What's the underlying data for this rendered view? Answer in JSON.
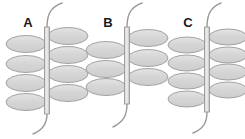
{
  "figure": {
    "background_color": "#ffffff",
    "width": 245,
    "height": 139,
    "leaflet_fill": "#d6d6d6",
    "leaflet_stroke": "#9a9a9a",
    "rachis_fill": "#e2e2e2",
    "rachis_stroke": "#9a9a9a",
    "label_color": "#1a1a1a"
  },
  "panels": [
    {
      "label": "A",
      "label_x": 28,
      "label_y": 27,
      "axis_x": 47,
      "leaflet_count_left": 4,
      "leaflet_count_right": 4,
      "leaflet_rx": 20,
      "leaflet_ry": 8.5,
      "left_leaflets": [
        {
          "cx": 26,
          "cy": 44
        },
        {
          "cx": 26,
          "cy": 64
        },
        {
          "cx": 26,
          "cy": 83
        },
        {
          "cx": 26,
          "cy": 102
        }
      ],
      "right_leaflets": [
        {
          "cx": 68,
          "cy": 36
        },
        {
          "cx": 68,
          "cy": 55
        },
        {
          "cx": 68,
          "cy": 74
        },
        {
          "cx": 68,
          "cy": 93
        }
      ],
      "rachis_top_y": 27,
      "rachis_bottom_y": 114,
      "tendril_top": "M47,27 C47,14 51,7 62,3",
      "tendril_bottom": "M47,114 C47,124 43,130 33,134"
    },
    {
      "label": "B",
      "label_x": 108,
      "label_y": 27,
      "axis_x": 127,
      "leaflet_count_left": 3,
      "leaflet_count_right": 3,
      "leaflet_rx": 20,
      "leaflet_ry": 8.5,
      "left_leaflets": [
        {
          "cx": 106,
          "cy": 50
        },
        {
          "cx": 106,
          "cy": 69
        },
        {
          "cx": 106,
          "cy": 87
        }
      ],
      "right_leaflets": [
        {
          "cx": 148,
          "cy": 38
        },
        {
          "cx": 148,
          "cy": 58
        },
        {
          "cx": 148,
          "cy": 77
        }
      ],
      "rachis_top_y": 27,
      "rachis_bottom_y": 104,
      "tendril_top": "M127,27 C127,14 131,7 142,3",
      "tendril_bottom": "M127,104 C127,116 123,122 113,127"
    },
    {
      "label": "C",
      "label_x": 188,
      "label_y": 27,
      "axis_x": 207,
      "leaflet_count_left": 4,
      "leaflet_count_right": 4,
      "leaflet_rx": 19,
      "leaflet_ry": 8,
      "left_leaflets": [
        {
          "cx": 187,
          "cy": 45
        },
        {
          "cx": 187,
          "cy": 63
        },
        {
          "cx": 187,
          "cy": 81
        },
        {
          "cx": 187,
          "cy": 99
        }
      ],
      "right_leaflets": [
        {
          "cx": 228,
          "cy": 37
        },
        {
          "cx": 228,
          "cy": 55
        },
        {
          "cx": 228,
          "cy": 72
        },
        {
          "cx": 228,
          "cy": 90
        }
      ],
      "rachis_top_y": 27,
      "rachis_bottom_y": 112,
      "tendril_top": "M207,27 C207,14 211,7 221,3",
      "tendril_bottom": "M207,112 C207,123 203,129 193,133"
    }
  ]
}
